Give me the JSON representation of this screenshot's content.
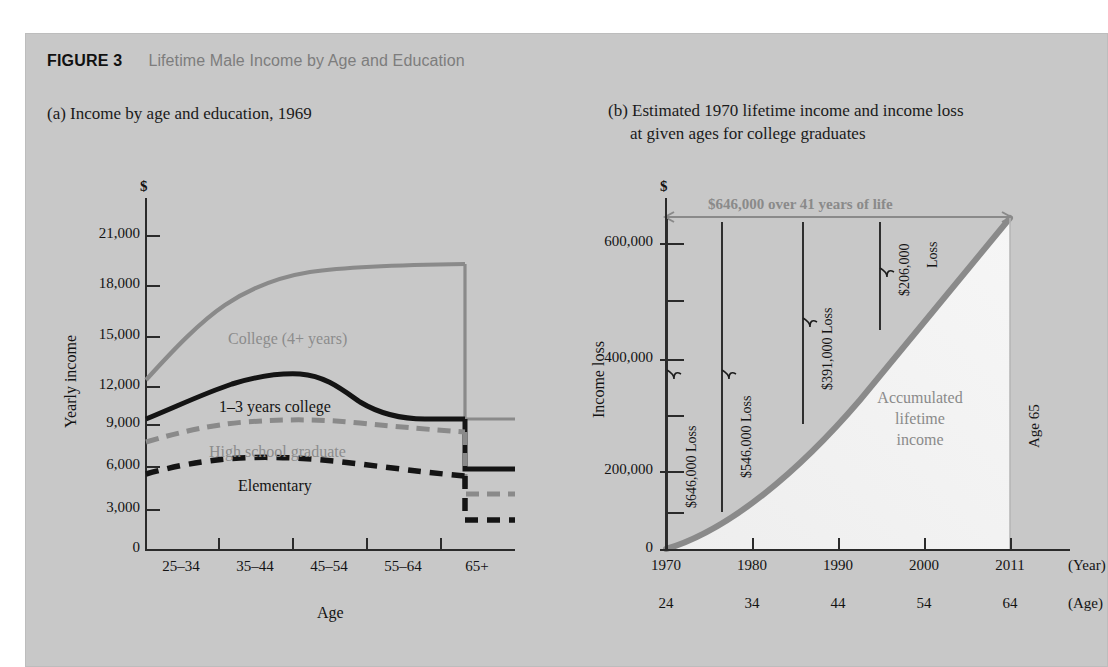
{
  "figure": {
    "number": "FIGURE 3",
    "title": "Lifetime Male Income by Age and Education",
    "panel_bg": "#c8c8c8",
    "accent_gray": "#8a8a8a",
    "ink": "#141414"
  },
  "panel_a": {
    "subtitle": "(a) Income by age and education, 1969",
    "dollar_sign": "$",
    "y_axis_label": "Yearly income",
    "x_axis_label": "Age",
    "y_ticks": [
      "21,000",
      "18,000",
      "15,000",
      "12,000",
      "9,000",
      "6,000",
      "3,000",
      "0"
    ],
    "x_ticks": [
      "25–34",
      "35–44",
      "45–54",
      "55–64",
      "65+"
    ],
    "series_labels": {
      "college": "College (4+ years)",
      "some_college": "1–3 years college",
      "high_school": "High school graduate",
      "elementary": "Elementary"
    }
  },
  "panel_b": {
    "subtitle_line1": "(b) Estimated 1970 lifetime income and income loss",
    "subtitle_line2": "at given ages for college graduates",
    "dollar_sign": "$",
    "y_axis_label": "Income loss",
    "y_ticks": [
      "600,000",
      "400,000",
      "200,000",
      "0"
    ],
    "x_ticks_year": [
      "1970",
      "1980",
      "1990",
      "2000",
      "2011"
    ],
    "x_ticks_age": [
      "24",
      "34",
      "44",
      "54",
      "64"
    ],
    "x_unit_year": "(Year)",
    "x_unit_age": "(Age)",
    "top_annotation": "$646,000 over 41 years of life",
    "loss_brackets": [
      {
        "label": "$646,000 Loss"
      },
      {
        "label": "$546,000 Loss"
      },
      {
        "label": "$391,000 Loss"
      },
      {
        "label": "$206,000"
      },
      {
        "label": "Loss"
      }
    ],
    "area_label_line1": "Accumulated",
    "area_label_line2": "lifetime",
    "area_label_line3": "income",
    "end_label": "Age 65"
  },
  "chart_data": [
    {
      "type": "line",
      "title": "(a) Income by age and education, 1969",
      "xlabel": "Age",
      "ylabel": "Yearly income",
      "categories": [
        "25–34",
        "35–44",
        "45–54",
        "55–64",
        "65+"
      ],
      "ylim": [
        0,
        22500
      ],
      "yticks": [
        0,
        3000,
        6000,
        9000,
        12000,
        15000,
        18000,
        21000
      ],
      "grid": false,
      "legend": "inline-labels",
      "series": [
        {
          "name": "College (4+ years)",
          "style": "solid-gray",
          "color": "#8a8a8a",
          "values": [
            10800,
            15200,
            17300,
            17900,
            10000
          ]
        },
        {
          "name": "1–3 years college",
          "style": "solid-black",
          "color": "#141414",
          "values": [
            8900,
            11200,
            11700,
            10400,
            6300
          ]
        },
        {
          "name": "High school graduate",
          "style": "dashed-gray",
          "color": "#8a8a8a",
          "values": [
            7700,
            8900,
            8900,
            8300,
            4900
          ]
        },
        {
          "name": "Elementary",
          "style": "dashed-black",
          "color": "#141414",
          "values": [
            5500,
            6300,
            6300,
            5700,
            3000
          ]
        }
      ]
    },
    {
      "type": "area",
      "title": "(b) Estimated 1970 lifetime income and income loss at given ages for college graduates",
      "xlabel": "(Year) / (Age)",
      "ylabel": "Income loss",
      "x": [
        "1970",
        "1980",
        "1990",
        "2000",
        "2011"
      ],
      "x_secondary": [
        "24",
        "34",
        "44",
        "54",
        "64"
      ],
      "ylim": [
        0,
        690000
      ],
      "yticks": [
        0,
        100000,
        200000,
        300000,
        400000,
        500000,
        600000
      ],
      "grid": false,
      "series": [
        {
          "name": "Accumulated lifetime income",
          "color": "#8a8a8a",
          "values": [
            0,
            100000,
            255000,
            440000,
            646000
          ]
        }
      ],
      "annotations": [
        {
          "text": "$646,000 over 41 years of life",
          "at_year": "1970-2011"
        },
        {
          "text": "$646,000 Loss",
          "at_year": "1970",
          "value": 646000
        },
        {
          "text": "$546,000 Loss",
          "at_year": "1980",
          "value": 546000
        },
        {
          "text": "$391,000 Loss",
          "at_year": "1990",
          "value": 391000
        },
        {
          "text": "$206,000 Loss",
          "at_year": "2000",
          "value": 206000
        },
        {
          "text": "Age 65",
          "at_year": "2011"
        }
      ]
    }
  ]
}
